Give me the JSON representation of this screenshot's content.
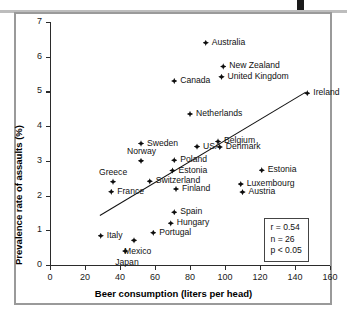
{
  "chart_data": {
    "type": "scatter",
    "title": "",
    "xlabel": "Beer consumption (liters per head)",
    "ylabel": "Prevalence rate of assaults (%)",
    "xlim": [
      0,
      160
    ],
    "ylim": [
      0,
      7
    ],
    "xticks": [
      0,
      20,
      40,
      60,
      80,
      100,
      120,
      140,
      160
    ],
    "yticks": [
      0,
      1,
      2,
      3,
      4,
      5,
      6,
      7
    ],
    "grid": false,
    "legend": "none",
    "points": [
      {
        "label": "Australia",
        "x": 89,
        "y": 6.4,
        "side": "r"
      },
      {
        "label": "New Zealand",
        "x": 99,
        "y": 5.72,
        "side": "r"
      },
      {
        "label": "United Kingdom",
        "x": 98,
        "y": 5.42,
        "side": "r"
      },
      {
        "label": "Canada",
        "x": 71,
        "y": 5.3,
        "side": "r"
      },
      {
        "label": "Ireland",
        "x": 147,
        "y": 4.95,
        "side": "r"
      },
      {
        "label": "Netherlands",
        "x": 80,
        "y": 4.35,
        "side": "r"
      },
      {
        "label": "Belgium",
        "x": 96,
        "y": 3.56,
        "side": "r"
      },
      {
        "label": "Sweden",
        "x": 52,
        "y": 3.5,
        "side": "r"
      },
      {
        "label": "Denmark",
        "x": 97,
        "y": 3.4,
        "side": "r"
      },
      {
        "label": "USA",
        "x": 84,
        "y": 3.41,
        "side": "r"
      },
      {
        "label": "Norway",
        "x": 52,
        "y": 3.0,
        "side": "above"
      },
      {
        "label": "Poland",
        "x": 71,
        "y": 3.02,
        "side": "r"
      },
      {
        "label": "Estonia",
        "x": 121,
        "y": 2.73,
        "side": "r"
      },
      {
        "label": "Estonia",
        "x": 70,
        "y": 2.72,
        "side": "r"
      },
      {
        "label": "Greece",
        "x": 36,
        "y": 2.4,
        "side": "above"
      },
      {
        "label": "Switzerland",
        "x": 57,
        "y": 2.41,
        "side": "r"
      },
      {
        "label": "Luxembourg",
        "x": 109,
        "y": 2.33,
        "side": "r"
      },
      {
        "label": "Finland",
        "x": 72,
        "y": 2.19,
        "side": "r"
      },
      {
        "label": "Austria",
        "x": 110,
        "y": 2.1,
        "side": "r"
      },
      {
        "label": "France",
        "x": 35,
        "y": 2.11,
        "side": "r"
      },
      {
        "label": "Spain",
        "x": 71,
        "y": 1.52,
        "side": "r"
      },
      {
        "label": "Hungary",
        "x": 69,
        "y": 1.2,
        "side": "r"
      },
      {
        "label": "Portugal",
        "x": 59,
        "y": 0.93,
        "side": "r"
      },
      {
        "label": "Italy",
        "x": 29,
        "y": 0.84,
        "side": "r"
      },
      {
        "label": "Mexico",
        "x": 48,
        "y": 0.71,
        "side": "below"
      },
      {
        "label": "Japan",
        "x": 43,
        "y": 0.4,
        "side": "below"
      }
    ],
    "trendline": {
      "x0": 28.5,
      "y0": 1.45,
      "x1": 146.0,
      "y1": 5.0
    },
    "annotations": {
      "r": "r = 0.54",
      "n": "n = 26",
      "p": "p < 0.05"
    }
  },
  "colors": {
    "marker": "#0d0d0d",
    "axis": "#2b2b2b",
    "frame": "#9a9a9a",
    "background": "#ffffff"
  }
}
